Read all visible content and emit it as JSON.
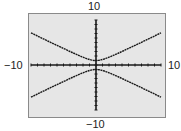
{
  "chart_data": {
    "type": "line",
    "title": "",
    "xlabel": "",
    "ylabel": "",
    "xlim": [
      -10,
      10
    ],
    "ylim": [
      -10,
      10
    ],
    "window_labels": {
      "ymax": "10",
      "ymin": "−10",
      "xmin": "−10",
      "xmax": "10"
    },
    "grid": false,
    "axis_ticks": {
      "x_step": 1,
      "y_step": 1
    },
    "series": [
      {
        "name": "upper branch",
        "x": [
          -10,
          -8,
          -6,
          -4,
          -2,
          0,
          2,
          4,
          6,
          8,
          10
        ],
        "y": [
          7.14,
          5.74,
          4.36,
          3.0,
          1.73,
          1.0,
          1.73,
          3.0,
          4.36,
          5.74,
          7.14
        ]
      },
      {
        "name": "lower branch",
        "x": [
          -10,
          -8,
          -6,
          -4,
          -2,
          0,
          2,
          4,
          6,
          8,
          10
        ],
        "y": [
          -7.14,
          -5.74,
          -4.36,
          -3.0,
          -1.73,
          -1.0,
          -1.73,
          -3.0,
          -4.36,
          -5.74,
          -7.14
        ]
      }
    ]
  },
  "colors": {
    "screen": "#e6e6e6",
    "border": "#8a8a8a",
    "curve": "#1a1a1a"
  }
}
